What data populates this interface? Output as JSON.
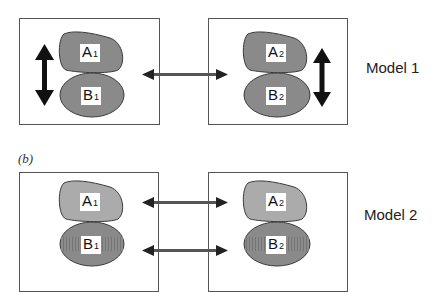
{
  "panel_a": {
    "model_label": "Model 1",
    "left": {
      "top_shape": {
        "letter": "A",
        "index": "1"
      },
      "bottom_shape": {
        "letter": "B",
        "index": "1"
      }
    },
    "right": {
      "top_shape": {
        "letter": "A",
        "index": "2"
      },
      "bottom_shape": {
        "letter": "B",
        "index": "2"
      }
    }
  },
  "panel_b": {
    "tag": "(b)",
    "model_label": "Model 2",
    "left": {
      "top_shape": {
        "letter": "A",
        "index": "1"
      },
      "bottom_shape": {
        "letter": "B",
        "index": "1"
      }
    },
    "right": {
      "top_shape": {
        "letter": "A",
        "index": "2"
      },
      "bottom_shape": {
        "letter": "B",
        "index": "2"
      }
    }
  },
  "colors": {
    "shape_dark": "#8a8a8a",
    "shape_light": "#ababab",
    "shape_stroke": "#3a3a3a",
    "arrow": "#111111",
    "box_border": "#555555"
  }
}
